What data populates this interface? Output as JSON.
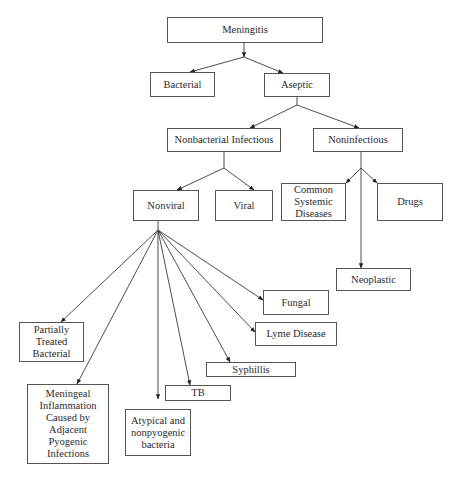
{
  "diagram": {
    "type": "tree",
    "nodes": {
      "meningitis": {
        "label": "Meningitis",
        "parent": null
      },
      "bacterial": {
        "label": "Bacterial",
        "parent": "meningitis"
      },
      "aseptic": {
        "label": "Aseptic",
        "parent": "meningitis"
      },
      "nonbacterial_infectious": {
        "label": "Nonbacterial Infectious",
        "parent": "aseptic"
      },
      "noninfectious": {
        "label": "Noninfectious",
        "parent": "aseptic"
      },
      "nonviral": {
        "label": "Nonviral",
        "parent": "nonbacterial_infectious"
      },
      "viral": {
        "label": "Viral",
        "parent": "nonbacterial_infectious"
      },
      "common_systemic_diseases": {
        "label": "Common\nSystemic\nDiseases",
        "parent": "noninfectious"
      },
      "drugs": {
        "label": "Drugs",
        "parent": "noninfectious"
      },
      "neoplastic": {
        "label": "Neoplastic",
        "parent": "noninfectious"
      },
      "fungal": {
        "label": "Fungal",
        "parent": "nonviral"
      },
      "lyme_disease": {
        "label": "Lyme Disease",
        "parent": "nonviral"
      },
      "syphillis": {
        "label": "Syphillis",
        "parent": "nonviral"
      },
      "tb": {
        "label": "TB",
        "parent": "nonviral"
      },
      "atypical_nonpyogenic_bacteria": {
        "label": "Atypical and\nnonpyogenic\nbacteria",
        "parent": "nonviral"
      },
      "meningeal_inflammation": {
        "label": "Meningeal\nInflammation\nCaused by\nAdjacent\nPyogenic\nInfections",
        "parent": "nonviral"
      },
      "partially_treated_bacterial": {
        "label": "Partially\nTreated\nBacterial",
        "parent": "nonviral"
      }
    },
    "colors": {
      "line": "#3a3a3a",
      "border": "#555555",
      "text": "#2a2a2a",
      "background": "#ffffff"
    }
  }
}
